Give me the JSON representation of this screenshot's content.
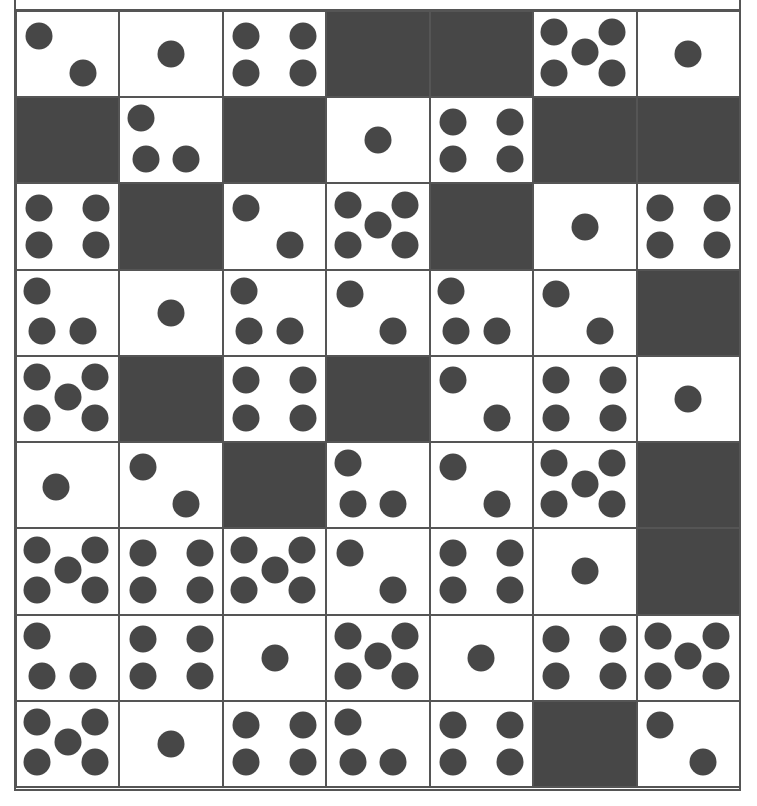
{
  "puzzle": {
    "columns": 7,
    "rows": 9,
    "colors": {
      "pip": "#474747",
      "dark_block": "#474747",
      "grid_line": "#555555",
      "face": "#ffffff"
    },
    "legend": "d = dark block; number = pip count; variant in pips layout",
    "cells": [
      [
        {
          "v": 2,
          "layout": "diag"
        },
        {
          "v": 1
        },
        {
          "v": 4
        },
        {
          "v": "d"
        },
        {
          "v": "d"
        },
        {
          "v": 5
        },
        {
          "v": 1
        }
      ],
      [
        {
          "v": "d"
        },
        {
          "v": 3,
          "layout": "L"
        },
        {
          "v": "d"
        },
        {
          "v": 1
        },
        {
          "v": 4
        },
        {
          "v": "d"
        },
        {
          "v": "d"
        }
      ],
      [
        {
          "v": 4
        },
        {
          "v": "d"
        },
        {
          "v": 2,
          "layout": "diag"
        },
        {
          "v": 5
        },
        {
          "v": "d"
        },
        {
          "v": 1
        },
        {
          "v": 4
        }
      ],
      [
        {
          "v": 3,
          "layout": "L"
        },
        {
          "v": 1
        },
        {
          "v": 3,
          "layout": "L"
        },
        {
          "v": 2,
          "layout": "diag"
        },
        {
          "v": 3,
          "layout": "L"
        },
        {
          "v": 2,
          "layout": "diag"
        },
        {
          "v": "d"
        }
      ],
      [
        {
          "v": 5
        },
        {
          "v": "d"
        },
        {
          "v": 4
        },
        {
          "v": "d"
        },
        {
          "v": 2,
          "layout": "diag"
        },
        {
          "v": 4
        },
        {
          "v": 1
        }
      ],
      [
        {
          "v": 1,
          "layout": "low-left"
        },
        {
          "v": 2,
          "layout": "diag"
        },
        {
          "v": "d"
        },
        {
          "v": 3,
          "layout": "L"
        },
        {
          "v": 2,
          "layout": "diag"
        },
        {
          "v": 5
        },
        {
          "v": "d"
        }
      ],
      [
        {
          "v": 5
        },
        {
          "v": 4
        },
        {
          "v": 5
        },
        {
          "v": 2,
          "layout": "diag"
        },
        {
          "v": 4
        },
        {
          "v": 1
        },
        {
          "v": "d"
        }
      ],
      [
        {
          "v": 3,
          "layout": "L"
        },
        {
          "v": 4
        },
        {
          "v": 1
        },
        {
          "v": 5
        },
        {
          "v": 1
        },
        {
          "v": 4
        },
        {
          "v": 5
        }
      ],
      [
        {
          "v": 5
        },
        {
          "v": 1
        },
        {
          "v": 4
        },
        {
          "v": 3,
          "layout": "L"
        },
        {
          "v": 4
        },
        {
          "v": "d"
        },
        {
          "v": 2,
          "layout": "diag"
        }
      ]
    ]
  }
}
